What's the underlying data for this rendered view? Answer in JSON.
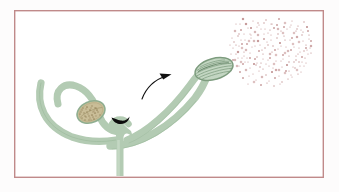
{
  "figure": {
    "title": "Pollen release from a flower anther",
    "caption": "",
    "domain": "biological-diagram"
  },
  "canvas": {
    "width": 339,
    "height": 192,
    "background_color": "#fdfcfc"
  },
  "frame": {
    "name": "illustration-border",
    "x": 14,
    "y": 10,
    "width": 310,
    "height": 168,
    "stroke_color": "#c08a8a",
    "stroke_width": 1.4,
    "fill_color": "#ffffff"
  },
  "colors": {
    "stalk_green": "#b3cbb3",
    "stalk_green_dark": "#8fae90",
    "stalk_green_edge": "#9dba9d",
    "anther_green_fill": "#c3d6c2",
    "anther_green_stroke": "#7d9c7e",
    "anther_tan_fill": "#c9bd97",
    "anther_tan_speck": "#8d7c52",
    "pollen_color": "#b47b7b",
    "arrow_color": "#111111",
    "stigma_black": "#0d0d0d",
    "border_rose": "#c08a8a"
  },
  "parts": {
    "left_outer_stalk": {
      "label": "left outer filament",
      "name": "filament-left-outer"
    },
    "left_inner_stalk": {
      "label": "left inner filament loop",
      "name": "filament-left-inner"
    },
    "right_inner_stalk": {
      "label": "right inner filament",
      "name": "filament-right-inner"
    },
    "right_outer_stalk": {
      "label": "right outer filament",
      "name": "filament-right-outer"
    },
    "main_stem": {
      "label": "main stem",
      "name": "main-stem"
    },
    "tan_anther": {
      "label": "unopened anther",
      "name": "anther-unopened",
      "cx": 91,
      "cy": 112,
      "rx": 14,
      "ry": 10,
      "rotation": -24,
      "speck_count": 46
    },
    "green_anther": {
      "label": "dehiscing anther",
      "name": "anther-dehiscing",
      "cx": 214,
      "cy": 69,
      "rx": 19,
      "ry": 10,
      "rotation": -16,
      "striation_count": 6
    },
    "stigma": {
      "label": "stigma",
      "name": "stigma-dark-crescent",
      "cx": 122,
      "cy": 119
    },
    "motion_arrow": {
      "label": "movement arrow",
      "name": "motion-arrow"
    },
    "pollen_cloud": {
      "label": "pollen cloud",
      "name": "pollen-cloud",
      "grain_count": 190,
      "bounds": {
        "x": 231,
        "y": 17,
        "width": 82,
        "height": 66
      }
    }
  },
  "pollen_points": [
    [
      246,
      24
    ],
    [
      253,
      21
    ],
    [
      259,
      25
    ],
    [
      266,
      20
    ],
    [
      272,
      24
    ],
    [
      279,
      19
    ],
    [
      285,
      23
    ],
    [
      292,
      21
    ],
    [
      298,
      26
    ],
    [
      304,
      22
    ],
    [
      241,
      30
    ],
    [
      248,
      28
    ],
    [
      255,
      32
    ],
    [
      261,
      29
    ],
    [
      268,
      33
    ],
    [
      274,
      28
    ],
    [
      281,
      31
    ],
    [
      287,
      29
    ],
    [
      294,
      33
    ],
    [
      301,
      30
    ],
    [
      307,
      27
    ],
    [
      238,
      36
    ],
    [
      244,
      34
    ],
    [
      251,
      38
    ],
    [
      258,
      35
    ],
    [
      264,
      39
    ],
    [
      271,
      35
    ],
    [
      277,
      38
    ],
    [
      284,
      36
    ],
    [
      290,
      40
    ],
    [
      297,
      37
    ],
    [
      303,
      41
    ],
    [
      309,
      35
    ],
    [
      234,
      42
    ],
    [
      241,
      40
    ],
    [
      247,
      44
    ],
    [
      254,
      41
    ],
    [
      260,
      45
    ],
    [
      267,
      42
    ],
    [
      273,
      46
    ],
    [
      280,
      43
    ],
    [
      286,
      47
    ],
    [
      293,
      44
    ],
    [
      299,
      48
    ],
    [
      306,
      45
    ],
    [
      311,
      41
    ],
    [
      233,
      48
    ],
    [
      239,
      46
    ],
    [
      246,
      50
    ],
    [
      252,
      47
    ],
    [
      259,
      51
    ],
    [
      265,
      48
    ],
    [
      272,
      52
    ],
    [
      278,
      49
    ],
    [
      285,
      53
    ],
    [
      291,
      50
    ],
    [
      298,
      54
    ],
    [
      304,
      51
    ],
    [
      310,
      48
    ],
    [
      231,
      54
    ],
    [
      238,
      52
    ],
    [
      244,
      56
    ],
    [
      250,
      53
    ],
    [
      257,
      57
    ],
    [
      263,
      54
    ],
    [
      270,
      58
    ],
    [
      276,
      55
    ],
    [
      283,
      59
    ],
    [
      289,
      56
    ],
    [
      296,
      60
    ],
    [
      302,
      57
    ],
    [
      308,
      54
    ],
    [
      235,
      60
    ],
    [
      242,
      58
    ],
    [
      248,
      62
    ],
    [
      255,
      59
    ],
    [
      261,
      63
    ],
    [
      268,
      60
    ],
    [
      274,
      64
    ],
    [
      281,
      61
    ],
    [
      287,
      65
    ],
    [
      294,
      62
    ],
    [
      300,
      66
    ],
    [
      306,
      63
    ],
    [
      237,
      66
    ],
    [
      243,
      64
    ],
    [
      250,
      68
    ],
    [
      256,
      65
    ],
    [
      263,
      69
    ],
    [
      269,
      66
    ],
    [
      276,
      70
    ],
    [
      282,
      67
    ],
    [
      289,
      71
    ],
    [
      295,
      68
    ],
    [
      301,
      72
    ],
    [
      240,
      72
    ],
    [
      246,
      70
    ],
    [
      253,
      74
    ],
    [
      259,
      71
    ],
    [
      266,
      75
    ],
    [
      272,
      72
    ],
    [
      279,
      76
    ],
    [
      285,
      73
    ],
    [
      292,
      77
    ],
    [
      298,
      74
    ],
    [
      243,
      78
    ],
    [
      249,
      76
    ],
    [
      256,
      80
    ],
    [
      262,
      77
    ],
    [
      269,
      81
    ],
    [
      275,
      78
    ],
    [
      282,
      82
    ],
    [
      288,
      79
    ],
    [
      248,
      84
    ],
    [
      254,
      82
    ],
    [
      261,
      85
    ],
    [
      267,
      83
    ],
    [
      274,
      86
    ],
    [
      280,
      84
    ],
    [
      236,
      24
    ],
    [
      243,
      19
    ],
    [
      250,
      34
    ],
    [
      257,
      27
    ],
    [
      264,
      23
    ],
    [
      270,
      30
    ],
    [
      277,
      25
    ],
    [
      283,
      33
    ],
    [
      290,
      27
    ],
    [
      296,
      31
    ],
    [
      302,
      35
    ],
    [
      308,
      31
    ],
    [
      240,
      24
    ],
    [
      235,
      31
    ],
    [
      232,
      38
    ],
    [
      230,
      45
    ],
    [
      233,
      60
    ],
    [
      236,
      54
    ],
    [
      239,
      66
    ],
    [
      242,
      48
    ],
    [
      245,
      62
    ],
    [
      251,
      28
    ],
    [
      258,
      23
    ],
    [
      265,
      29
    ],
    [
      271,
      24
    ],
    [
      278,
      29
    ],
    [
      284,
      27
    ],
    [
      291,
      25
    ],
    [
      297,
      29
    ],
    [
      303,
      32
    ],
    [
      309,
      39
    ],
    [
      311,
      46
    ],
    [
      307,
      50
    ],
    [
      305,
      58
    ],
    [
      299,
      62
    ],
    [
      293,
      67
    ],
    [
      286,
      71
    ],
    [
      279,
      70
    ],
    [
      273,
      68
    ],
    [
      266,
      64
    ],
    [
      260,
      67
    ],
    [
      254,
      64
    ],
    [
      247,
      58
    ],
    [
      241,
      62
    ],
    [
      238,
      58
    ],
    [
      244,
      52
    ],
    [
      250,
      58
    ],
    [
      257,
      63
    ],
    [
      263,
      59
    ],
    [
      270,
      54
    ],
    [
      276,
      61
    ],
    [
      283,
      55
    ],
    [
      289,
      62
    ],
    [
      296,
      56
    ],
    [
      302,
      62
    ],
    [
      299,
      42
    ],
    [
      292,
      38
    ],
    [
      285,
      40
    ],
    [
      278,
      34
    ],
    [
      271,
      40
    ],
    [
      264,
      34
    ],
    [
      258,
      41
    ],
    [
      251,
      35
    ],
    [
      245,
      40
    ],
    [
      239,
      34
    ],
    [
      236,
      45
    ],
    [
      242,
      44
    ],
    [
      249,
      41
    ],
    [
      255,
      46
    ],
    [
      262,
      50
    ],
    [
      268,
      45
    ],
    [
      275,
      50
    ],
    [
      281,
      46
    ],
    [
      288,
      51
    ],
    [
      294,
      47
    ],
    [
      300,
      52
    ],
    [
      306,
      48
    ],
    [
      311,
      53
    ],
    [
      304,
      66
    ],
    [
      297,
      70
    ],
    [
      291,
      75
    ]
  ],
  "tan_specks": [
    [
      84,
      106
    ],
    [
      88,
      104
    ],
    [
      92,
      106
    ],
    [
      96,
      108
    ],
    [
      82,
      110
    ],
    [
      86,
      109
    ],
    [
      90,
      110
    ],
    [
      94,
      111
    ],
    [
      98,
      112
    ],
    [
      80,
      114
    ],
    [
      84,
      113
    ],
    [
      88,
      114
    ],
    [
      92,
      115
    ],
    [
      96,
      116
    ],
    [
      100,
      115
    ],
    [
      82,
      118
    ],
    [
      86,
      117
    ],
    [
      90,
      118
    ],
    [
      94,
      119
    ],
    [
      98,
      119
    ],
    [
      84,
      121
    ],
    [
      88,
      122
    ],
    [
      92,
      122
    ],
    [
      96,
      122
    ],
    [
      86,
      125
    ],
    [
      90,
      125
    ],
    [
      94,
      125
    ],
    [
      83,
      108
    ],
    [
      87,
      112
    ],
    [
      91,
      108
    ],
    [
      95,
      113
    ],
    [
      99,
      117
    ],
    [
      81,
      112
    ],
    [
      85,
      116
    ],
    [
      89,
      120
    ],
    [
      93,
      112
    ],
    [
      97,
      110
    ],
    [
      101,
      118
    ],
    [
      85,
      120
    ],
    [
      93,
      117
    ],
    [
      89,
      116
    ],
    [
      97,
      120
    ],
    [
      87,
      107
    ],
    [
      91,
      120
    ],
    [
      95,
      108
    ]
  ]
}
